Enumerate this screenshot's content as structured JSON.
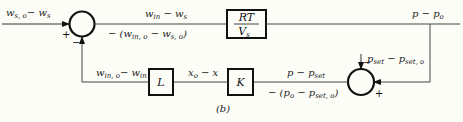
{
  "diagram": {
    "caption": "(b)",
    "input_signal": {
      "main": "w",
      "sub1": "s, o",
      "mid": "− w",
      "sub2": "s"
    },
    "sum1": {
      "plus": "+",
      "minus": "−"
    },
    "sum2": {
      "plus": "+",
      "minus": "−"
    },
    "signal_top_upper": {
      "a": "w",
      "a_sub": "in",
      "mid": " − w",
      "b_sub": "s"
    },
    "signal_top_lower": {
      "pre": "− (w",
      "a_sub": "in, o",
      "mid": " − w",
      "b_sub": "s, o",
      "post": ")"
    },
    "block_rtv": {
      "num": "RT",
      "den": "V",
      "den_sub": "s"
    },
    "output_signal": {
      "a": "p − p",
      "a_sub": "o"
    },
    "setpoint_signal": {
      "a": "p",
      "a_sub": "set",
      "mid": " − p",
      "b_sub": "set, o"
    },
    "signal_bottom_upper": {
      "a": "p − p",
      "a_sub": "set"
    },
    "signal_bottom_lower": {
      "pre": "− (p",
      "a_sub": "o",
      "mid": " − p",
      "b_sub": "set, o",
      "post": ")"
    },
    "block_k": {
      "label": "K"
    },
    "signal_x": {
      "a": "x",
      "a_sub": "o",
      "mid": " − x"
    },
    "block_l": {
      "label": "L"
    },
    "signal_feedback": {
      "a": "w",
      "a_sub": "in, o",
      "mid": "− w",
      "b_sub": "in"
    }
  }
}
